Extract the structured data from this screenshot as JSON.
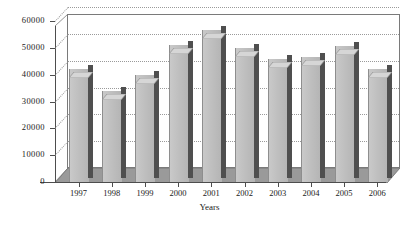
{
  "chart_data": {
    "type": "bar",
    "title": "",
    "xlabel": "Years",
    "ylabel": "",
    "categories": [
      "1997",
      "1998",
      "1999",
      "2000",
      "2001",
      "2002",
      "2003",
      "2004",
      "2005",
      "2006"
    ],
    "values": [
      42000,
      34000,
      40000,
      51000,
      56500,
      50000,
      45800,
      46500,
      50700,
      42000
    ],
    "ylim": [
      0,
      60000
    ],
    "ytick_labels": [
      "0",
      "10000",
      "20000",
      "30000",
      "40000",
      "50000",
      "60000"
    ],
    "ytick_values": [
      0,
      10000,
      20000,
      30000,
      40000,
      50000,
      60000
    ],
    "grid": true,
    "legend": false,
    "style": "3d-column",
    "colors": {
      "bar_front": "#bfbfbf",
      "bar_side": "#4f4f4f",
      "bar_top": "#d8d8d8",
      "floor": "#9a9a9a",
      "wall": "#ffffff",
      "axis": "#4d4d4d",
      "grid": "#9a9a9a",
      "text": "#1a1a1a"
    }
  }
}
